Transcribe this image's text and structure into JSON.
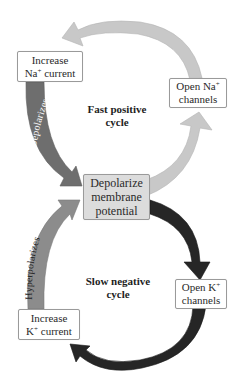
{
  "diagram": {
    "type": "feedback-cycles",
    "colors": {
      "fast_cycle_arrow": "#c8c8c8",
      "depolarizes_arrow": "#6e6e6e",
      "hyperpolarizes_arrow": "#8c8c8c",
      "slow_cycle_arrow": "#262626",
      "center_box_fill": "#dcdcdc",
      "box_border": "#9a9a9a"
    },
    "nodes": {
      "increase_na": {
        "line1": "Increase",
        "line2_pre": "Na",
        "line2_sup": "+",
        "line2_post": " current"
      },
      "open_na": {
        "line1_pre": "Open Na",
        "line1_sup": "+",
        "line2": "channels"
      },
      "depolarize": {
        "line1": "Depolarize",
        "line2": "membrane",
        "line3": "potential"
      },
      "open_k": {
        "line1_pre": "Open K",
        "line1_sup": "+",
        "line2": "channels"
      },
      "increase_k": {
        "line1": "Increase",
        "line2_pre": "K",
        "line2_sup": "+",
        "line2_post": " current"
      }
    },
    "cycles": {
      "fast": {
        "line1": "Fast positive",
        "line2": "cycle"
      },
      "slow": {
        "line1": "Slow negative",
        "line2": "cycle"
      }
    },
    "arrow_labels": {
      "depolarizes": "Depolarizes",
      "hyperpolarizes": "Hyperpolarizes"
    }
  }
}
